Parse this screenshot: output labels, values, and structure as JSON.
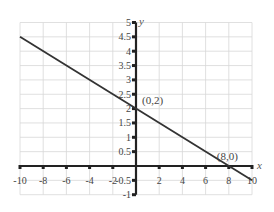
{
  "chart_data": {
    "type": "line",
    "title": "",
    "xlabel": "x",
    "ylabel": "y",
    "xlim": [
      -10,
      10
    ],
    "ylim": [
      -1,
      5
    ],
    "grid": true,
    "x_ticks": [
      -10,
      -8,
      -6,
      -4,
      -2,
      2,
      4,
      6,
      8,
      10
    ],
    "x_tick_labels": [
      "-10",
      "-8",
      "-6",
      "-4",
      "-2",
      "2",
      "4",
      "6",
      "8",
      "10"
    ],
    "y_ticks": [
      5,
      4.5,
      4,
      3.5,
      3,
      2.5,
      2,
      1.5,
      1,
      0.5,
      -0.5,
      -1
    ],
    "y_tick_labels": [
      "5",
      "4.5",
      "4",
      "3.5",
      "3",
      "2.5",
      "2",
      "1.5",
      "1",
      "0.5",
      "-0.5",
      "-1"
    ],
    "series": [
      {
        "name": "y = -x/4 + 2",
        "x": [
          -10,
          10
        ],
        "y": [
          4.5,
          -0.5
        ],
        "color": "#333333"
      }
    ],
    "annotations": [
      {
        "text": "(0,2)",
        "x": 0,
        "y": 2
      },
      {
        "text": "(8,0)",
        "x": 8,
        "y": 0
      }
    ]
  }
}
